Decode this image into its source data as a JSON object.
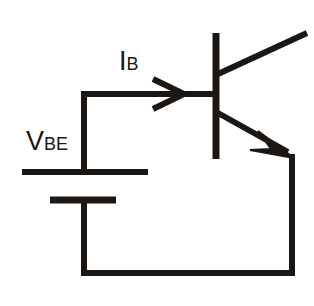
{
  "diagram": {
    "background_color": "#ffffff",
    "line_color": "#1c1713",
    "labels": {
      "vbe": {
        "symbol": "V",
        "subscript": "BE",
        "full": "VBE"
      },
      "ib": {
        "symbol": "I",
        "subscript": "B",
        "full": "IB"
      }
    },
    "components": [
      {
        "name": "battery",
        "type": "dc-voltage-source",
        "label": "VBE"
      },
      {
        "name": "transistor",
        "type": "npn-bjt"
      },
      {
        "name": "base-current-arrow",
        "type": "current-direction-arrow",
        "label": "IB"
      }
    ],
    "nodes": {
      "left_rail_x": 84,
      "base_wire_y": 94,
      "bottom_rail_y": 273,
      "right_rail_x": 292,
      "base_bar_x": 216,
      "battery_top_plate_y": 172,
      "battery_bottom_plate_y": 200,
      "emitter_tip_y": 156,
      "collector_tip_x": 306,
      "collector_tip_y": 34
    }
  }
}
